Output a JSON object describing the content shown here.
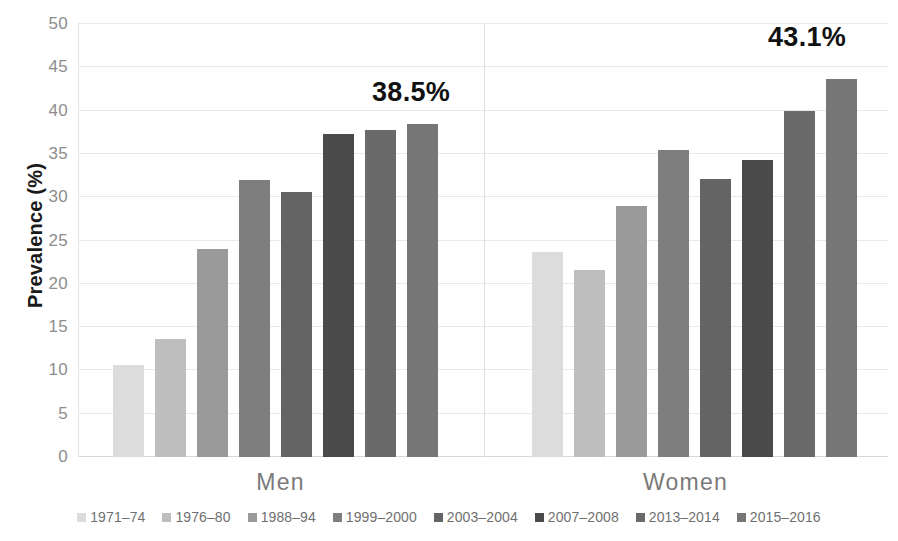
{
  "chart_data": {
    "type": "bar",
    "title": "",
    "xlabel": "",
    "ylabel": "Prevalence (%)",
    "ylim": [
      0,
      50
    ],
    "ytick_step": 5,
    "ytick_labels": [
      "50",
      "45",
      "40",
      "35",
      "30",
      "25",
      "20",
      "15",
      "10",
      "5",
      "0"
    ],
    "grid": true,
    "legend_position": "bottom",
    "categories": [
      "Men",
      "Women"
    ],
    "series": [
      {
        "name": "1971–74",
        "color": "#dcdcdc",
        "values": [
          10.6,
          23.7
        ]
      },
      {
        "name": "1976–80",
        "color": "#bebebe",
        "values": [
          13.6,
          21.6
        ]
      },
      {
        "name": "1988–94",
        "color": "#9a9a9a",
        "values": [
          24.0,
          29.0
        ]
      },
      {
        "name": "1999–2000",
        "color": "#7e7e7e",
        "values": [
          32.0,
          35.4
        ]
      },
      {
        "name": "2003–2004",
        "color": "#646464",
        "values": [
          30.6,
          32.1
        ]
      },
      {
        "name": "2007–2008",
        "color": "#4a4a4a",
        "values": [
          37.3,
          34.3
        ]
      },
      {
        "name": "2013–2014",
        "color": "#6a6a6a",
        "values": [
          37.8,
          39.9
        ]
      },
      {
        "name": "2015–2016",
        "color": "#767676",
        "values": [
          38.5,
          43.6
        ]
      }
    ],
    "annotations": [
      {
        "text": "38.5%",
        "group": "Men"
      },
      {
        "text": "43.1%",
        "group": "Women"
      }
    ]
  }
}
